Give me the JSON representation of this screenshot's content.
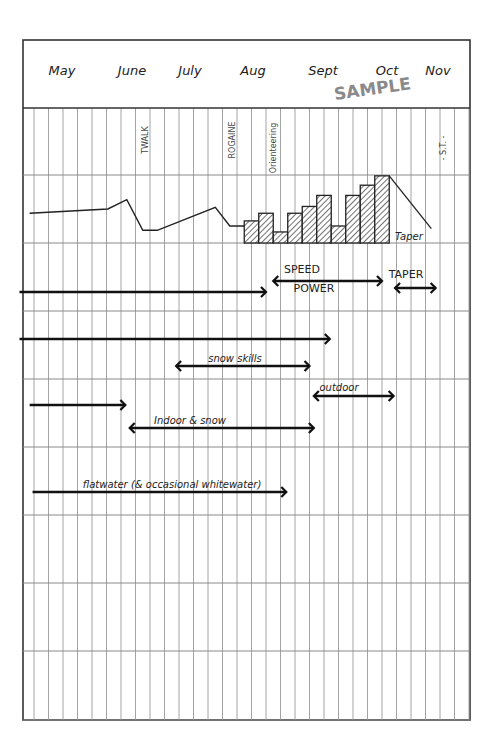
{
  "chart_data": {
    "type": "timeline",
    "title": "",
    "watermark": "SAMPLE",
    "months": [
      "May",
      "June",
      "July",
      "Aug",
      "Sept",
      "Oct",
      "Nov"
    ],
    "weeks_per_month": 4,
    "total_week_columns": 31,
    "events": [
      {
        "label": "TWALK",
        "week": 8
      },
      {
        "label": "ROGAINE",
        "week": 14
      },
      {
        "label": "Orienteering",
        "week": 17
      },
      {
        "label": "- S.T. -",
        "week": 28
      }
    ],
    "volume_line": {
      "description": "training load line before block periodisation",
      "points": [
        {
          "week": -0.3,
          "load": 1.75
        },
        {
          "week": 5.1,
          "load": 2.0
        },
        {
          "week": 6.4,
          "load": 2.55
        },
        {
          "week": 7.5,
          "load": 0.75
        },
        {
          "week": 8.5,
          "load": 0.75
        },
        {
          "week": 12.5,
          "load": 2.1
        },
        {
          "week": 13.5,
          "load": 1.0
        },
        {
          "week": 14.5,
          "load": 1.0
        }
      ]
    },
    "volume_bars": {
      "description": "weekly load bars (hatched)",
      "start_week": 14.5,
      "values": [
        1.3,
        1.75,
        0.65,
        1.75,
        2.15,
        2.8,
        1.0,
        2.8,
        3.4,
        3.95
      ]
    },
    "taper_line": {
      "label": "Taper",
      "from": {
        "week": 24.5,
        "load": 3.95
      },
      "to": {
        "week": 27.4,
        "load": 0.85
      }
    },
    "load_range": [
      0,
      4
    ],
    "arrows": [
      {
        "label": "",
        "start_week": -1,
        "end_week": 16.0,
        "row": 1,
        "heads": "end"
      },
      {
        "label_top": "SPEED",
        "label_bottom": "POWER",
        "start_week": 16.5,
        "end_week": 24.0,
        "row": 1,
        "heads": "both"
      },
      {
        "label": "TAPER",
        "start_week": 24.9,
        "end_week": 27.7,
        "row": 1,
        "heads": "both"
      },
      {
        "label": "",
        "start_week": -1,
        "end_week": 20.4,
        "row": 2,
        "heads": "end"
      },
      {
        "label": "snow skills",
        "start_week": 9.8,
        "end_week": 19.0,
        "row": 2,
        "heads": "both"
      },
      {
        "label": "outdoor",
        "start_week": 19.3,
        "end_week": 24.8,
        "row": 3,
        "heads": "both"
      },
      {
        "label": "",
        "start_week": -0.3,
        "end_week": 6.3,
        "row": 3,
        "heads": "end"
      },
      {
        "label": "Indoor & snow",
        "start_week": 6.6,
        "end_week": 19.3,
        "row": 3,
        "heads": "both"
      },
      {
        "label": "flatwater (& occasional whitewater)",
        "start_week": -0.1,
        "end_week": 17.4,
        "row": 4,
        "heads": "end"
      }
    ]
  }
}
